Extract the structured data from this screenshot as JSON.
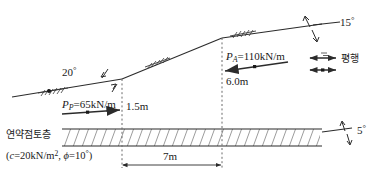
{
  "figure": {
    "soil_layer_label": "연약점토층",
    "soil_params": {
      "cohesion_symbol": "c",
      "cohesion_value": "=20kN/m",
      "cohesion_exponent": "2",
      "phi_symbol": "ϕ",
      "phi_value": "=10",
      "phi_degree": "°",
      "open_paren": "(",
      "comma": ",",
      "close_paren": ")"
    },
    "forces": [
      {
        "name": "passive-force",
        "symbol": "P",
        "subscript": "P",
        "value": "=65kN/m"
      },
      {
        "name": "active-force",
        "symbol": "P",
        "subscript": "A",
        "value": "=110kN/m"
      }
    ],
    "dimensions": [
      {
        "name": "lower-height",
        "label": "1.5m"
      },
      {
        "name": "upper-height",
        "label": "6.0m"
      },
      {
        "name": "horizontal-span",
        "label": "7m"
      }
    ],
    "angles": [
      {
        "name": "lower-slope-angle",
        "value": "20",
        "degree": "°"
      },
      {
        "name": "upper-slope-angle",
        "value": "15",
        "degree": "°"
      },
      {
        "name": "clay-base-angle",
        "value": "5",
        "degree": "°"
      }
    ],
    "parallel_note": "평행",
    "colors": {
      "line": "#2b2b2b",
      "hatch": "#3a3a3a",
      "dashed": "#6b6b6b",
      "text": "#1a1a1a",
      "background": "#ffffff"
    }
  }
}
